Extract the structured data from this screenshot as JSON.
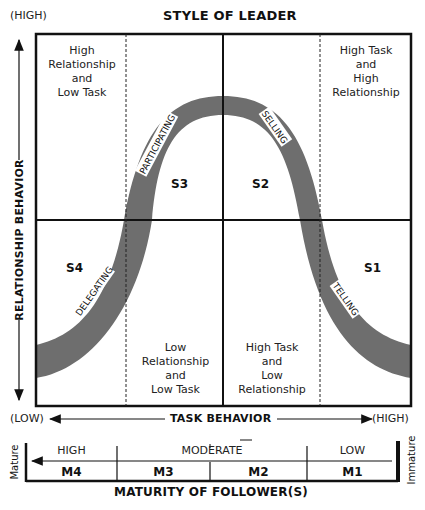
{
  "diagram": {
    "title": "STYLE OF LEADER",
    "y_axis": {
      "label": "RELATIONSHIP BEHAVIOR",
      "high": "(HIGH)",
      "low": "(LOW)"
    },
    "x_axis": {
      "label": "TASK BEHAVIOR",
      "low": "(LOW)",
      "high": "(HIGH)"
    },
    "quadrant_descriptions": [
      {
        "id": "top-left",
        "lines": [
          "High",
          "Relationship",
          "and",
          "Low Task"
        ]
      },
      {
        "id": "top-right",
        "lines": [
          "High Task",
          "and",
          "High",
          "Relationship"
        ]
      },
      {
        "id": "bottom-left",
        "lines": [
          "Low",
          "Relationship",
          "and",
          "Low Task"
        ]
      },
      {
        "id": "bottom-right",
        "lines": [
          "High Task",
          "and",
          "Low",
          "Relationship"
        ]
      }
    ],
    "styles": [
      {
        "code": "S1",
        "name": "TELLING"
      },
      {
        "code": "S2",
        "name": "SELLING"
      },
      {
        "code": "S3",
        "name": "PARTICIPATING"
      },
      {
        "code": "S4",
        "name": "DELEGATING"
      }
    ],
    "curve_color": "#6e6e6e",
    "maturity": {
      "title": "MATURITY OF FOLLOWER(S)",
      "left_end": "Mature",
      "right_end": "Immature",
      "levels": [
        {
          "range": "HIGH",
          "code": "M4"
        },
        {
          "range": "MODERATE",
          "code": "M3"
        },
        {
          "range": "",
          "code": "M2"
        },
        {
          "range": "LOW",
          "code": "M1"
        }
      ],
      "moderate_label": "MODERATE"
    }
  }
}
